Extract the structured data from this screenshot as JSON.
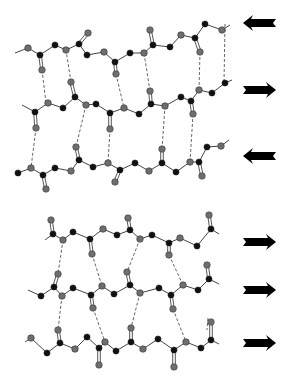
{
  "figure": {
    "colors": {
      "carbon_black": "#111111",
      "gray_atom": "#6e6e6e",
      "bond": "#444444",
      "hbond": "#555555",
      "arrow": "#000000"
    },
    "panels": [
      {
        "name": "antiparallel-sheet",
        "arrows": [
          {
            "direction": "left",
            "y": 23
          },
          {
            "direction": "right",
            "y": 90
          },
          {
            "direction": "left",
            "y": 156
          }
        ],
        "strands": [
          {
            "atoms": [
              [
                15,
                53,
                "l"
              ],
              [
                28,
                48,
                "g"
              ],
              [
                40,
                55,
                "b"
              ],
              [
                55,
                45,
                "b"
              ],
              [
                66,
                50,
                "g"
              ],
              [
                79,
                44,
                "b"
              ],
              [
                87,
                55,
                "b"
              ],
              [
                104,
                52,
                "g"
              ],
              [
                115,
                62,
                "b"
              ],
              [
                130,
                53,
                "b"
              ],
              [
                144,
                53,
                "g"
              ],
              [
                153,
                45,
                "b"
              ],
              [
                170,
                47,
                "b"
              ],
              [
                181,
                35,
                "g"
              ],
              [
                195,
                38,
                "b"
              ],
              [
                205,
                24,
                "b"
              ],
              [
                222,
                30,
                "g"
              ],
              [
                230,
                25,
                "l"
              ]
            ],
            "carbonyls": [
              [
                40,
                55,
                42,
                70
              ],
              [
                79,
                44,
                88,
                33
              ],
              [
                115,
                62,
                116,
                74
              ],
              [
                153,
                45,
                150,
                30
              ],
              [
                195,
                38,
                200,
                52
              ]
            ]
          },
          {
            "atoms": [
              [
                22,
                105,
                "l"
              ],
              [
                35,
                112,
                "b"
              ],
              [
                48,
                103,
                "g"
              ],
              [
                63,
                108,
                "b"
              ],
              [
                75,
                97,
                "b"
              ],
              [
                86,
                105,
                "g"
              ],
              [
                96,
                104,
                "b"
              ],
              [
                110,
                113,
                "b"
              ],
              [
                124,
                108,
                "g"
              ],
              [
                139,
                114,
                "b"
              ],
              [
                151,
                104,
                "b"
              ],
              [
                165,
                106,
                "g"
              ],
              [
                181,
                97,
                "b"
              ],
              [
                191,
                101,
                "b"
              ],
              [
                199,
                90,
                "g"
              ],
              [
                212,
                93,
                "b"
              ],
              [
                225,
                83,
                "b"
              ],
              [
                232,
                80,
                "l"
              ]
            ],
            "carbonyls": [
              [
                35,
                112,
                36,
                128
              ],
              [
                75,
                97,
                71,
                82
              ],
              [
                110,
                113,
                110,
                129
              ],
              [
                151,
                104,
                150,
                91
              ],
              [
                191,
                101,
                193,
                114
              ]
            ]
          },
          {
            "atoms": [
              [
                18,
                173,
                "b"
              ],
              [
                31,
                168,
                "g"
              ],
              [
                43,
                175,
                "b"
              ],
              [
                55,
                168,
                "b"
              ],
              [
                71,
                171,
                "g"
              ],
              [
                79,
                160,
                "b"
              ],
              [
                93,
                167,
                "b"
              ],
              [
                108,
                163,
                "g"
              ],
              [
                120,
                170,
                "b"
              ],
              [
                135,
                163,
                "b"
              ],
              [
                149,
                171,
                "g"
              ],
              [
                162,
                163,
                "b"
              ],
              [
                176,
                172,
                "b"
              ],
              [
                190,
                162,
                "g"
              ],
              [
                199,
                162,
                "b"
              ],
              [
                207,
                147,
                "b"
              ],
              [
                221,
                146,
                "g"
              ],
              [
                229,
                140,
                "l"
              ]
            ],
            "carbonyls": [
              [
                43,
                175,
                46,
                189
              ],
              [
                79,
                160,
                76,
                147
              ],
              [
                120,
                170,
                115,
                182
              ],
              [
                162,
                163,
                162,
                149
              ],
              [
                199,
                162,
                202,
                176
              ]
            ]
          }
        ],
        "hbonds": [
          [
            42,
            70,
            46,
            103
          ],
          [
            71,
            82,
            66,
            50
          ],
          [
            116,
            74,
            124,
            108
          ],
          [
            150,
            91,
            144,
            53
          ],
          [
            200,
            52,
            199,
            90
          ],
          [
            36,
            128,
            31,
            168
          ],
          [
            86,
            105,
            76,
            147
          ],
          [
            110,
            129,
            108,
            163
          ],
          [
            165,
            106,
            162,
            149
          ],
          [
            193,
            114,
            190,
            162
          ],
          [
            225,
            24,
            224,
            84
          ]
        ]
      },
      {
        "name": "parallel-sheet",
        "arrows": [
          {
            "direction": "right",
            "y": 242
          },
          {
            "direction": "right",
            "y": 290
          },
          {
            "direction": "right",
            "y": 343
          }
        ],
        "strands": [
          {
            "atoms": [
              [
                45,
                240,
                "l"
              ],
              [
                53,
                234,
                "b"
              ],
              [
                63,
                240,
                "g"
              ],
              [
                73,
                232,
                "b"
              ],
              [
                90,
                239,
                "b"
              ],
              [
                103,
                229,
                "g"
              ],
              [
                117,
                235,
                "b"
              ],
              [
                130,
                230,
                "b"
              ],
              [
                140,
                239,
                "g"
              ],
              [
                152,
                235,
                "b"
              ],
              [
                169,
                243,
                "b"
              ],
              [
                180,
                238,
                "g"
              ],
              [
                197,
                246,
                "b"
              ],
              [
                211,
                229,
                "b"
              ],
              [
                219,
                234,
                "l"
              ]
            ],
            "carbonyls": [
              [
                53,
                234,
                51,
                220
              ],
              [
                90,
                239,
                92,
                254
              ],
              [
                130,
                230,
                128,
                218
              ],
              [
                169,
                243,
                169,
                255
              ],
              [
                211,
                229,
                209,
                215
              ]
            ]
          },
          {
            "atoms": [
              [
                28,
                290,
                "l"
              ],
              [
                41,
                296,
                "b"
              ],
              [
                54,
                287,
                "b"
              ],
              [
                62,
                296,
                "g"
              ],
              [
                73,
                288,
                "b"
              ],
              [
                91,
                295,
                "b"
              ],
              [
                102,
                286,
                "g"
              ],
              [
                114,
                294,
                "b"
              ],
              [
                130,
                285,
                "b"
              ],
              [
                140,
                293,
                "g"
              ],
              [
                159,
                288,
                "b"
              ],
              [
                171,
                295,
                "b"
              ],
              [
                183,
                285,
                "g"
              ],
              [
                198,
                290,
                "b"
              ],
              [
                209,
                279,
                "b"
              ],
              [
                219,
                284,
                "l"
              ]
            ],
            "carbonyls": [
              [
                54,
                287,
                58,
                274
              ],
              [
                91,
                295,
                93,
                308
              ],
              [
                130,
                285,
                127,
                272
              ],
              [
                171,
                295,
                173,
                309
              ],
              [
                209,
                279,
                207,
                265
              ]
            ]
          },
          {
            "atoms": [
              [
                25,
                342,
                "l"
              ],
              [
                31,
                338,
                "g"
              ],
              [
                47,
                353,
                "b"
              ],
              [
                60,
                343,
                "b"
              ],
              [
                75,
                349,
                "g"
              ],
              [
                87,
                337,
                "b"
              ],
              [
                99,
                348,
                "b"
              ],
              [
                105,
                342,
                "g"
              ],
              [
                116,
                351,
                "b"
              ],
              [
                131,
                342,
                "b"
              ],
              [
                143,
                349,
                "g"
              ],
              [
                158,
                339,
                "b"
              ],
              [
                174,
                350,
                "b"
              ],
              [
                186,
                342,
                "g"
              ],
              [
                201,
                348,
                "b"
              ],
              [
                211,
                340,
                "b"
              ],
              [
                219,
                344,
                "l"
              ]
            ],
            "carbonyls": [
              [
                60,
                343,
                58,
                330
              ],
              [
                99,
                348,
                99,
                365
              ],
              [
                131,
                342,
                131,
                328
              ],
              [
                174,
                350,
                174,
                367
              ],
              [
                211,
                340,
                211,
                322
              ]
            ]
          }
        ],
        "hbonds": [
          [
            63,
            240,
            58,
            274
          ],
          [
            92,
            254,
            102,
            286
          ],
          [
            140,
            239,
            127,
            272
          ],
          [
            169,
            255,
            183,
            285
          ],
          [
            62,
            296,
            58,
            330
          ],
          [
            93,
            308,
            105,
            342
          ],
          [
            140,
            293,
            131,
            328
          ],
          [
            173,
            309,
            186,
            342
          ],
          [
            208,
            318,
            207,
            330
          ]
        ]
      }
    ]
  }
}
